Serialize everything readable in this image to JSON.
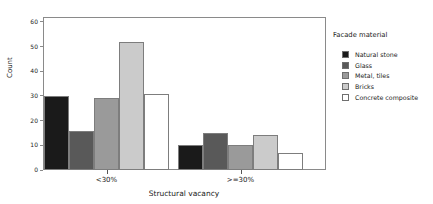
{
  "chart_data": {
    "type": "bar",
    "title": "",
    "xlabel": "Structural vacancy",
    "ylabel": "Count",
    "categories": [
      "<30%",
      ">=30%"
    ],
    "series": [
      {
        "name": "Natural stone",
        "color": "#1a1a1a",
        "values": [
          30,
          10
        ]
      },
      {
        "name": "Glass",
        "color": "#595959",
        "values": [
          16,
          15
        ]
      },
      {
        "name": "Metal, tiles",
        "color": "#9a9a9a",
        "values": [
          29,
          10
        ]
      },
      {
        "name": "Bricks",
        "color": "#cbcbcb",
        "values": [
          52,
          14
        ]
      },
      {
        "name": "Concrete composite",
        "color": "#ffffff",
        "values": [
          31,
          7
        ]
      }
    ],
    "ylim": [
      0,
      62
    ],
    "yticks": [
      0,
      10,
      20,
      30,
      40,
      50,
      60
    ],
    "grid": false,
    "legend": {
      "title": "Facade material",
      "position": "right"
    }
  }
}
